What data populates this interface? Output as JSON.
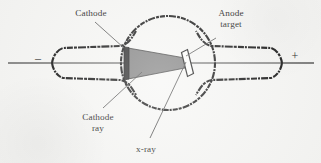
{
  "figure": {
    "background_color": "#f6f6f4",
    "ink_color": "#141414",
    "cathode_ray_fill": "#7e7e7e",
    "leader_line_color": "#555555",
    "labels": {
      "cathode": "Cathode",
      "anode_line1": "Anode",
      "anode_line2": "target",
      "cathode_ray_line1": "Cathode",
      "cathode_ray_line2": "ray",
      "xray": "x-ray",
      "negative_terminal": "–",
      "positive_terminal": "+"
    }
  },
  "diagram_data": {
    "type": "diagram",
    "subject": "Crookes x-ray tube",
    "components": [
      {
        "name": "cathode",
        "label": "Cathode",
        "shape": "dark-vertical-bar",
        "x": 124,
        "y": 63
      },
      {
        "name": "cathode-ray-cone",
        "label": "Cathode ray",
        "shape": "gray-triangle-cone",
        "from_x": 126,
        "to_x": 184,
        "y": 63
      },
      {
        "name": "anode-target",
        "label": "Anode target",
        "shape": "tilted-thin-rectangle",
        "x": 186,
        "y": 63
      },
      {
        "name": "x-ray-beam",
        "label": "x-ray",
        "shape": "line",
        "from_x": 186,
        "from_y": 63,
        "to_x": 150,
        "to_y": 140
      },
      {
        "name": "tube-envelope",
        "label": "glass envelope",
        "shape": "circular-bulb-with-two-tapered-necks"
      },
      {
        "name": "negative-lead",
        "label": "–",
        "x": 38,
        "y": 60
      },
      {
        "name": "positive-lead",
        "label": "+",
        "x": 295,
        "y": 57
      }
    ]
  }
}
